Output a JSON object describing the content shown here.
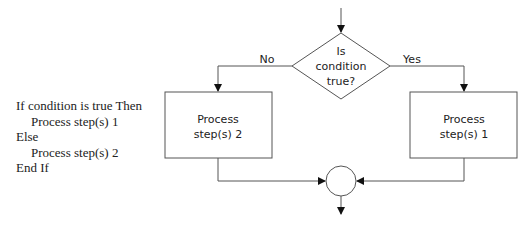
{
  "pseudocode": {
    "lines": [
      {
        "text": "If condition is true Then",
        "indent": false
      },
      {
        "text": "Process step(s) 1",
        "indent": true
      },
      {
        "text": "Else",
        "indent": false
      },
      {
        "text": "Process step(s) 2",
        "indent": true
      },
      {
        "text": "End If",
        "indent": false
      }
    ]
  },
  "flowchart": {
    "decision": {
      "line1": "Is",
      "line2": "condition",
      "line3": "true?"
    },
    "no_label": "No",
    "yes_label": "Yes",
    "left_box": {
      "line1": "Process",
      "line2": "step(s) 2"
    },
    "right_box": {
      "line1": "Process",
      "line2": "step(s) 1"
    }
  }
}
